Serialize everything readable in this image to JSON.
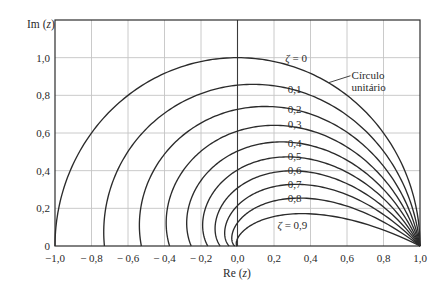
{
  "chart_data": {
    "type": "line",
    "title": "",
    "xlabel": "Re (z)",
    "ylabel": "Im (z)",
    "xlim": [
      -1.0,
      1.0
    ],
    "ylim": [
      0,
      1.2
    ],
    "grid": true,
    "legend": null,
    "x_ticks": [
      -1.0,
      -0.8,
      -0.6,
      -0.4,
      -0.2,
      0.0,
      0.2,
      0.4,
      0.6,
      0.8,
      1.0
    ],
    "x_tick_labels": [
      "−1,0",
      "− 0,8",
      "− 0,6",
      "− 0,4",
      "− 0,2",
      "0,0",
      "0,2",
      "0,4",
      "0,6",
      "0,8",
      "1,0"
    ],
    "y_ticks": [
      0,
      0.2,
      0.4,
      0.6,
      0.8,
      1.0
    ],
    "y_tick_labels": [
      "0",
      "0,2",
      "0,4",
      "0,6",
      "0,8",
      "1,0"
    ],
    "curve_definition": "Constant-damping loci z = e^{-ζθ/√(1-ζ²)}(cosθ + j sinθ), θ from 0 to π",
    "series": [
      {
        "name": "ζ = 0",
        "zeta": 0.0,
        "label": "ζ = 0",
        "real_axis_intercept": -1.0,
        "points": [
          [
            1,
            0
          ],
          [
            0.707,
            0.707
          ],
          [
            0,
            1.0
          ],
          [
            -0.707,
            0.707
          ],
          [
            -1.0,
            0
          ]
        ]
      },
      {
        "name": "ζ = 0,1",
        "zeta": 0.1,
        "label": "0,1",
        "real_axis_intercept": -0.729,
        "points": [
          [
            1,
            0
          ],
          [
            0.653,
            0.653
          ],
          [
            0,
            0.854
          ],
          [
            -0.558,
            0.558
          ],
          [
            -0.729,
            0
          ]
        ]
      },
      {
        "name": "ζ = 0,2",
        "zeta": 0.2,
        "label": "0,2",
        "real_axis_intercept": -0.527,
        "points": [
          [
            1,
            0
          ],
          [
            0.602,
            0.602
          ],
          [
            0,
            0.726
          ],
          [
            -0.437,
            0.437
          ],
          [
            -0.527,
            0
          ]
        ]
      },
      {
        "name": "ζ = 0,3",
        "zeta": 0.3,
        "label": "0,3",
        "real_axis_intercept": -0.372,
        "points": [
          [
            1,
            0
          ],
          [
            0.552,
            0.552
          ],
          [
            0,
            0.61
          ],
          [
            -0.337,
            0.337
          ],
          [
            -0.372,
            0
          ]
        ]
      },
      {
        "name": "ζ = 0,4",
        "zeta": 0.4,
        "label": "0,4",
        "real_axis_intercept": -0.254,
        "points": [
          [
            1,
            0
          ],
          [
            0.502,
            0.502
          ],
          [
            0,
            0.504
          ],
          [
            -0.253,
            0.253
          ],
          [
            -0.254,
            0
          ]
        ]
      },
      {
        "name": "ζ = 0,5",
        "zeta": 0.5,
        "label": "0,5",
        "real_axis_intercept": -0.163,
        "points": [
          [
            1,
            0
          ],
          [
            0.449,
            0.449
          ],
          [
            0,
            0.404
          ],
          [
            -0.182,
            0.182
          ],
          [
            -0.163,
            0
          ]
        ]
      },
      {
        "name": "ζ = 0,6",
        "zeta": 0.6,
        "label": "0,6",
        "real_axis_intercept": -0.095,
        "points": [
          [
            1,
            0
          ],
          [
            0.392,
            0.392
          ],
          [
            0,
            0.308
          ],
          [
            -0.121,
            0.121
          ],
          [
            -0.095,
            0
          ]
        ]
      },
      {
        "name": "ζ = 0,7",
        "zeta": 0.7,
        "label": "0,7",
        "real_axis_intercept": -0.046,
        "points": [
          [
            1,
            0
          ],
          [
            0.327,
            0.327
          ],
          [
            0,
            0.214
          ],
          [
            -0.07,
            0.07
          ],
          [
            -0.046,
            0
          ]
        ]
      },
      {
        "name": "ζ = 0,8",
        "zeta": 0.8,
        "label": "0,8",
        "real_axis_intercept": -0.015,
        "points": [
          [
            1,
            0
          ],
          [
            0.248,
            0.248
          ],
          [
            0,
            0.123
          ],
          [
            -0.03,
            0.03
          ],
          [
            -0.015,
            0
          ]
        ]
      },
      {
        "name": "ζ = 0,9",
        "zeta": 0.9,
        "label": "ζ = 0,9",
        "real_axis_intercept": -0.0015,
        "points": [
          [
            1,
            0
          ],
          [
            0.14,
            0.14
          ],
          [
            0,
            0.039
          ],
          [
            -0.005,
            0.005
          ],
          [
            -0.0015,
            0
          ]
        ]
      }
    ],
    "annotations": [
      {
        "text": "ζ = 0",
        "x": 0.262,
        "y": 0.975
      },
      {
        "text": "0,1",
        "x": 0.276,
        "y": 0.815
      },
      {
        "text": "0,2",
        "x": 0.276,
        "y": 0.708
      },
      {
        "text": "0,3",
        "x": 0.276,
        "y": 0.628
      },
      {
        "text": "0,4",
        "x": 0.276,
        "y": 0.527
      },
      {
        "text": "0,5",
        "x": 0.276,
        "y": 0.458
      },
      {
        "text": "0,6",
        "x": 0.276,
        "y": 0.384
      },
      {
        "text": "0,7",
        "x": 0.276,
        "y": 0.309
      },
      {
        "text": "0,8",
        "x": 0.276,
        "y": 0.234
      },
      {
        "text": "ζ = 0,9",
        "x": 0.219,
        "y": 0.092
      },
      {
        "text": "Círculo",
        "x": 0.625,
        "y": 0.885
      },
      {
        "text": "unitário",
        "x": 0.625,
        "y": 0.823
      }
    ],
    "leader_line": {
      "from": [
        0.499,
        0.867
      ],
      "to": [
        0.619,
        0.904
      ],
      "target": "Círculo unitário"
    }
  },
  "axes": {
    "x_title_main": "Re (",
    "x_title_var": "z",
    "x_title_close": ")",
    "y_title_main": "Im (",
    "y_title_var": "z",
    "y_title_close": ")"
  }
}
